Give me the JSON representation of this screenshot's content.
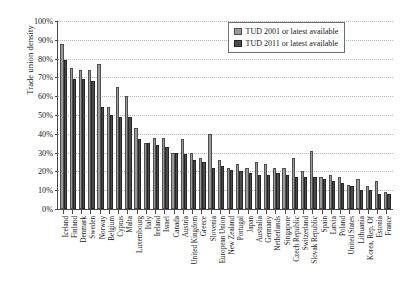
{
  "chart_data": {
    "type": "bar",
    "title": "",
    "xlabel": "",
    "ylabel": "Trade union density",
    "ylim": [
      0,
      100
    ],
    "ytick_labels": [
      "100%",
      "90%",
      "80%",
      "70%",
      "60%",
      "50%",
      "40%",
      "30%",
      "20%",
      "10%",
      "0%"
    ],
    "ytick_values": [
      100,
      90,
      80,
      70,
      60,
      50,
      40,
      30,
      20,
      10,
      0
    ],
    "grid": true,
    "legend_position": "top-right",
    "categories": [
      "Iceland",
      "Finland",
      "Denmark",
      "Sweden",
      "Norway",
      "Belgium",
      "Cyprus",
      "Malta",
      "Luxembourg",
      "Italy",
      "Ireland",
      "Israel",
      "Canada",
      "Austria",
      "United Kingdom",
      "Greece",
      "Slovenia",
      "European Union",
      "New Zealand",
      "Portugal",
      "Japan",
      "Australia",
      "Germany",
      "Netherlands",
      "Singapore",
      "Czech Republic",
      "Switzerland",
      "Slovak Republic",
      "Spain",
      "Latvia",
      "Poland",
      "United States",
      "Lithuania",
      "Korea, Rep. Of",
      "Estonia",
      "France"
    ],
    "series": [
      {
        "name": "TUD 2001 or latest available",
        "color": "#9a9a9a",
        "values": [
          88,
          75,
          74,
          74,
          77,
          54,
          65,
          60,
          43,
          35,
          38,
          38,
          30,
          37,
          30,
          27,
          40,
          26,
          22,
          24,
          22,
          25,
          24,
          22,
          22,
          27,
          20,
          31,
          17,
          18,
          17,
          13,
          16,
          12,
          15,
          9
        ]
      },
      {
        "name": "TUD 2011 or latest available",
        "color": "#4b4b4b",
        "values": [
          79,
          69,
          69,
          68,
          54,
          50,
          49,
          49,
          37,
          35,
          34,
          33,
          30,
          29,
          26,
          25,
          22,
          23,
          21,
          20,
          19,
          18,
          18,
          19,
          18,
          17,
          17,
          17,
          16,
          15,
          14,
          12,
          10,
          10,
          8,
          8
        ]
      }
    ]
  },
  "legend": {
    "items": [
      {
        "label": "TUD 2001 or latest available"
      },
      {
        "label": "TUD 2011 or latest available"
      }
    ]
  }
}
